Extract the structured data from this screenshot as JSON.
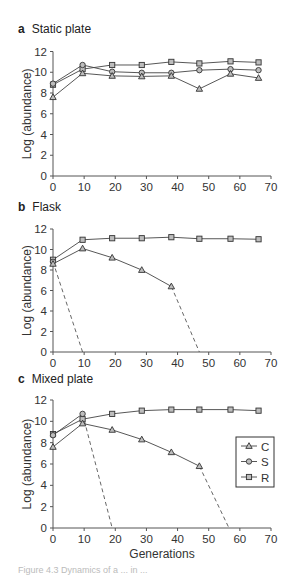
{
  "figure": {
    "ylabel": "Log (abundance)",
    "xlabel": "Generations",
    "legend": [
      {
        "label": "C",
        "marker": "triangle"
      },
      {
        "label": "S",
        "marker": "circle"
      },
      {
        "label": "R",
        "marker": "square"
      }
    ],
    "caption_partial": "Figure 4.3 Dynamics of a ... in ... "
  },
  "panels": [
    {
      "letter": "a",
      "title": "Static plate"
    },
    {
      "letter": "b",
      "title": "Flask"
    },
    {
      "letter": "c",
      "title": "Mixed plate"
    }
  ],
  "chart_data": [
    {
      "type": "line",
      "title": "a Static plate",
      "xlabel": "",
      "ylabel": "Log (abundance)",
      "xlim": [
        0,
        70
      ],
      "ylim": [
        0,
        12
      ],
      "xticks": [
        0,
        10,
        20,
        30,
        40,
        50,
        60,
        70
      ],
      "yticks": [
        0,
        2,
        4,
        6,
        8,
        10,
        12
      ],
      "grid": false,
      "series": [
        {
          "name": "C",
          "marker": "triangle",
          "x": [
            0,
            9.5,
            19,
            28.5,
            38,
            47,
            57,
            66
          ],
          "values": [
            7.6,
            9.9,
            9.65,
            9.6,
            9.65,
            8.4,
            9.85,
            9.45
          ]
        },
        {
          "name": "S",
          "marker": "circle",
          "x": [
            0,
            9.5,
            19,
            28.5,
            38,
            47,
            57,
            66
          ],
          "values": [
            8.9,
            10.7,
            10.05,
            9.95,
            9.95,
            10.2,
            10.3,
            10.2
          ]
        },
        {
          "name": "R",
          "marker": "square",
          "x": [
            0,
            9.5,
            19,
            28.5,
            38,
            47,
            57,
            66
          ],
          "values": [
            8.8,
            10.3,
            10.7,
            10.7,
            11.0,
            10.85,
            11.05,
            10.95
          ]
        }
      ]
    },
    {
      "type": "line",
      "title": "b Flask",
      "xlabel": "",
      "ylabel": "Log (abundance)",
      "xlim": [
        0,
        70
      ],
      "ylim": [
        0,
        12
      ],
      "xticks": [
        0,
        10,
        20,
        30,
        40,
        50,
        60,
        70
      ],
      "yticks": [
        0,
        2,
        4,
        6,
        8,
        10,
        12
      ],
      "grid": false,
      "series": [
        {
          "name": "C",
          "marker": "triangle",
          "x": [
            0,
            9.5,
            19,
            28.5,
            38
          ],
          "values": [
            8.6,
            10.1,
            9.2,
            8.0,
            6.4
          ],
          "extinction": {
            "x": [
              38,
              47
            ],
            "values": [
              6.4,
              0
            ],
            "style": "dashed"
          }
        },
        {
          "name": "S",
          "marker": "circle",
          "x": [
            0
          ],
          "values": [
            8.8
          ],
          "extinction": {
            "x": [
              0,
              9.5
            ],
            "values": [
              8.8,
              0
            ],
            "style": "dashed"
          }
        },
        {
          "name": "R",
          "marker": "square",
          "x": [
            0,
            9.5,
            19,
            28.5,
            38,
            47,
            57,
            66
          ],
          "values": [
            9.0,
            10.95,
            11.1,
            11.1,
            11.2,
            11.05,
            11.05,
            11.0
          ]
        }
      ]
    },
    {
      "type": "line",
      "title": "c Mixed plate",
      "xlabel": "Generations",
      "ylabel": "Log (abundance)",
      "xlim": [
        0,
        70
      ],
      "ylim": [
        0,
        12
      ],
      "xticks": [
        0,
        10,
        20,
        30,
        40,
        50,
        60,
        70
      ],
      "yticks": [
        0,
        2,
        4,
        6,
        8,
        10,
        12
      ],
      "grid": false,
      "legend_position": "right-middle",
      "series": [
        {
          "name": "C",
          "marker": "triangle",
          "x": [
            0,
            9.5,
            19,
            28.5,
            38,
            47
          ],
          "values": [
            7.6,
            9.8,
            9.2,
            8.3,
            7.1,
            5.8
          ],
          "extinction": {
            "x": [
              47,
              56.5
            ],
            "values": [
              5.8,
              0
            ],
            "style": "dashed"
          }
        },
        {
          "name": "S",
          "marker": "circle",
          "x": [
            0,
            9.5
          ],
          "values": [
            8.7,
            10.7
          ],
          "extinction": {
            "x": [
              9.5,
              19
            ],
            "values": [
              10.7,
              0
            ],
            "style": "dashed"
          }
        },
        {
          "name": "R",
          "marker": "square",
          "x": [
            0,
            9.5,
            19,
            28.5,
            38,
            47,
            57,
            66
          ],
          "values": [
            8.8,
            10.2,
            10.7,
            11.0,
            11.1,
            11.1,
            11.1,
            11.0
          ]
        }
      ]
    }
  ]
}
